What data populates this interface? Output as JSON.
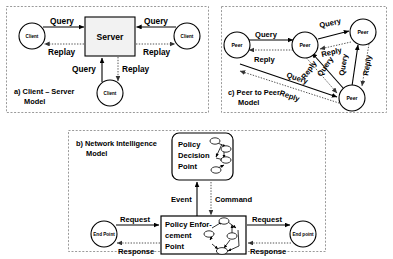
{
  "figure": {
    "background": "#ffffff",
    "panel_border_color": "#9a9a9a",
    "solid_edge_color": "#000000",
    "dotted_edge_color": "#555555",
    "server_fill": "#f2f2f2"
  },
  "panel_a": {
    "caption_line1": "a) Client – Server",
    "caption_line2": "Model",
    "server_label": "Server",
    "clients": [
      {
        "label": "Client",
        "position": "left"
      },
      {
        "label": "Client",
        "position": "right"
      },
      {
        "label": "Client",
        "position": "bottom"
      }
    ],
    "edges": [
      {
        "from": "Client (left)",
        "to": "Server",
        "label": "Query",
        "style": "solid"
      },
      {
        "from": "Server",
        "to": "Client (left)",
        "label": "Replay",
        "style": "dotted"
      },
      {
        "from": "Client (right)",
        "to": "Server",
        "label": "Query",
        "style": "solid"
      },
      {
        "from": "Server",
        "to": "Client (right)",
        "label": "Replay",
        "style": "dotted"
      },
      {
        "from": "Client (bottom)",
        "to": "Server",
        "label": "Query",
        "style": "solid"
      },
      {
        "from": "Server",
        "to": "Client (bottom)",
        "label": "Replay",
        "style": "dotted"
      }
    ],
    "edge_labels": {
      "left_query": "Query",
      "left_replay": "Replay",
      "right_query": "Query",
      "right_replay": "Replay",
      "bottom_query": "Query",
      "bottom_replay": "Replay"
    }
  },
  "panel_c": {
    "caption_line1": "c) Peer to Peer",
    "caption_line2": "Model",
    "peers": [
      {
        "id": "peer-left",
        "label": "Peer"
      },
      {
        "id": "peer-center",
        "label": "Peer"
      },
      {
        "id": "peer-top-right",
        "label": "Peer"
      },
      {
        "id": "peer-bottom-right",
        "label": "Peer"
      }
    ],
    "edges": [
      {
        "from": "peer-left",
        "to": "peer-center",
        "label": "Query",
        "style": "solid"
      },
      {
        "from": "peer-center",
        "to": "peer-left",
        "label": "Reply",
        "style": "dotted"
      },
      {
        "from": "peer-center",
        "to": "peer-top-right",
        "label": "Query",
        "style": "solid"
      },
      {
        "from": "peer-top-right",
        "to": "peer-center",
        "label": "Reply",
        "style": "dotted"
      },
      {
        "from": "peer-bottom-right",
        "to": "peer-center",
        "label": "Query",
        "style": "solid"
      },
      {
        "from": "peer-center",
        "to": "peer-bottom-right",
        "label": "Reply",
        "style": "dotted"
      },
      {
        "from": "peer-bottom-right",
        "to": "peer-top-right",
        "label": "Query",
        "style": "solid"
      },
      {
        "from": "peer-top-right",
        "to": "peer-bottom-right",
        "label": "Reply",
        "style": "dotted"
      },
      {
        "from": "peer-left",
        "to": "peer-bottom-right",
        "label": "Query",
        "style": "solid"
      },
      {
        "from": "peer-bottom-right",
        "to": "peer-left",
        "label": "Reply",
        "style": "dotted"
      }
    ],
    "edge_labels": {
      "left_center_query": "Query",
      "center_left_reply": "Reply",
      "center_topright_query": "Query",
      "topright_center_reply": "Reply",
      "bottomright_center_query": "Query",
      "center_bottomright_reply": "Reply",
      "bottomright_topright_query": "Query",
      "topright_bottomright_reply": "Reply",
      "left_bottomright_query": "Query",
      "bottomright_left_reply": "Reply"
    }
  },
  "panel_b": {
    "caption_line1": "b) Network Intelligence",
    "caption_line2": "Model",
    "policy_decision_point": {
      "line1": "Policy",
      "line2": "Decision",
      "line3": "Point"
    },
    "policy_enforcement_point": {
      "line1": "Policy Enfor-",
      "line2": "cement",
      "line3": "Point"
    },
    "endpoints": [
      {
        "id": "endpoint-left",
        "label": "End Point"
      },
      {
        "id": "endpoint-right",
        "label": "End point"
      }
    ],
    "edges": [
      {
        "from": "Policy Enforcement Point",
        "to": "Policy Decision Point",
        "label": "Event",
        "style": "solid"
      },
      {
        "from": "Policy Decision Point",
        "to": "Policy Enforcement Point",
        "label": "Command",
        "style": "dotted"
      },
      {
        "from": "End Point",
        "to": "Policy Enforcement Point",
        "label": "Request",
        "style": "solid"
      },
      {
        "from": "Policy Enforcement Point",
        "to": "End Point",
        "label": "Response",
        "style": "dotted"
      },
      {
        "from": "Policy Enforcement Point",
        "to": "End point",
        "label": "Request",
        "style": "solid"
      },
      {
        "from": "End point",
        "to": "Policy Enforcement Point",
        "label": "Response",
        "style": "dotted"
      }
    ],
    "edge_labels": {
      "event": "Event",
      "command": "Command",
      "left_request": "Request",
      "left_response": "Response",
      "right_request": "Request",
      "right_response": "Response"
    }
  }
}
